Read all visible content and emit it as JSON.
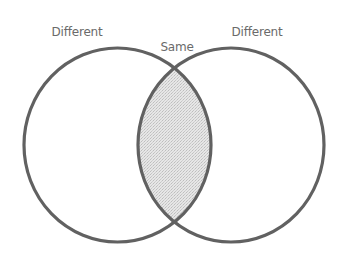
{
  "diagram": {
    "type": "venn",
    "sets": [
      {
        "id": "left",
        "label": "Different"
      },
      {
        "id": "right",
        "label": "Different"
      }
    ],
    "intersection": {
      "label": "Same",
      "fill": "shaded"
    },
    "labels": {
      "left": "Different",
      "right": "Different",
      "center": "Same"
    },
    "colors": {
      "stroke": "#616161",
      "shade": "#dcdcdc",
      "text": "#6a6a6a",
      "background": "#ffffff"
    }
  }
}
